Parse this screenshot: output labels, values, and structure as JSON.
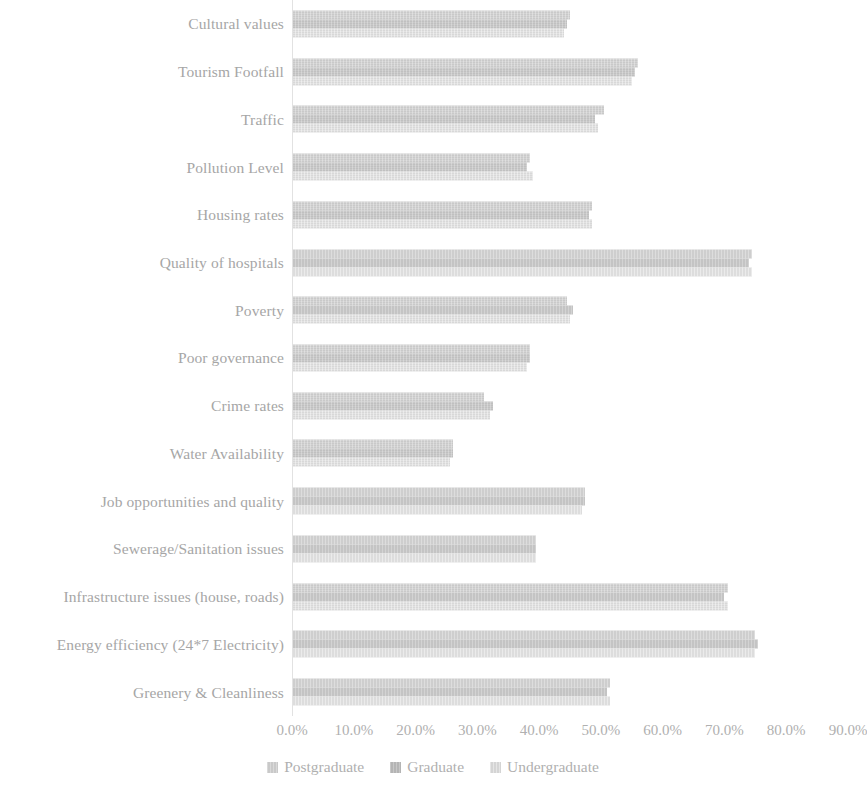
{
  "chart_data": {
    "type": "bar",
    "orientation": "horizontal",
    "title": "",
    "subtitle": "",
    "xlabel": "",
    "ylabel": "",
    "xlim": [
      0,
      90
    ],
    "xtick_labels": [
      "0.0%",
      "10.0%",
      "20.0%",
      "30.0%",
      "40.0%",
      "50.0%",
      "60.0%",
      "70.0%",
      "80.0%",
      "90.0%"
    ],
    "xtick_values": [
      0,
      10,
      20,
      30,
      40,
      50,
      60,
      70,
      80,
      90
    ],
    "grid": false,
    "legend_position": "bottom",
    "categories": [
      "Cultural values",
      "Tourism Footfall",
      "Traffic",
      "Pollution Level",
      "Housing rates",
      "Quality of hospitals",
      "Poverty",
      "Poor governance",
      "Crime rates",
      "Water Availability",
      "Job opportunities and quality",
      "Sewerage/Sanitation issues",
      "Infrastructure issues (house, roads)",
      "Energy efficiency (24*7 Electricity)",
      "Greenery & Cleanliness"
    ],
    "series": [
      {
        "name": "Postgraduate",
        "color": "#c9c9c9",
        "values": [
          45.0,
          56.0,
          50.5,
          38.5,
          48.5,
          74.5,
          44.5,
          38.5,
          31.0,
          26.0,
          47.5,
          39.5,
          70.5,
          75.0,
          51.5
        ]
      },
      {
        "name": "Graduate",
        "color": "#c0c0c0",
        "values": [
          44.5,
          55.5,
          49.0,
          38.0,
          48.0,
          74.0,
          45.5,
          38.5,
          32.5,
          26.0,
          47.5,
          39.5,
          70.0,
          75.5,
          51.0
        ]
      },
      {
        "name": "Undergraduate",
        "color": "#d8d8d8",
        "values": [
          44.0,
          55.0,
          49.5,
          39.0,
          48.5,
          74.5,
          45.0,
          38.0,
          32.0,
          25.5,
          47.0,
          39.5,
          70.5,
          75.0,
          51.5
        ]
      }
    ]
  },
  "legend": {
    "items": [
      {
        "label": "Postgraduate"
      },
      {
        "label": "Graduate"
      },
      {
        "label": "Undergraduate"
      }
    ]
  }
}
